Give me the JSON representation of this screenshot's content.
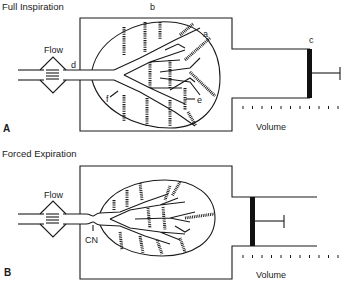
{
  "figure": {
    "panels": [
      {
        "id": "A",
        "panel_label": "A",
        "title": "Full Inspiration",
        "flow_label": "Flow",
        "volume_label": "Volume",
        "labels": {
          "a": "a",
          "b": "b",
          "c": "c",
          "d": "d",
          "e": "e",
          "f": "f"
        }
      },
      {
        "id": "B",
        "panel_label": "B",
        "title": "Forced Expiration",
        "flow_label": "Flow",
        "volume_label": "Volume",
        "labels": {
          "cn": "CN"
        }
      }
    ]
  }
}
